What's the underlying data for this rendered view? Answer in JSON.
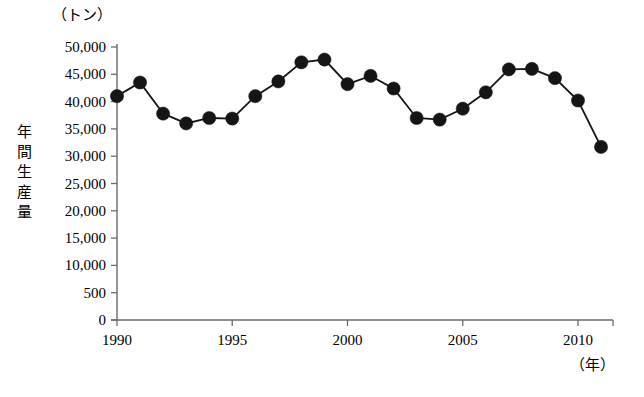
{
  "chart_data": {
    "type": "line",
    "title": "",
    "subtitle": "",
    "xlabel": "（年）",
    "ylabel": "年間生産量",
    "yunit": "（トン）",
    "x": [
      1990,
      1991,
      1992,
      1993,
      1994,
      1995,
      1996,
      1997,
      1998,
      1999,
      2000,
      2001,
      2002,
      2003,
      2004,
      2005,
      2006,
      2007,
      2008,
      2009,
      2010,
      2011
    ],
    "values": [
      41000,
      43500,
      37800,
      36000,
      37000,
      36900,
      41000,
      43700,
      47200,
      47700,
      43200,
      44700,
      42400,
      37000,
      36700,
      38700,
      41700,
      45900,
      46000,
      44300,
      40200,
      31700
    ],
    "series": [
      {
        "name": "年間生産量",
        "values": [
          41000,
          43500,
          37800,
          36000,
          37000,
          36900,
          41000,
          43700,
          47200,
          47700,
          43200,
          44700,
          42400,
          37000,
          36700,
          38700,
          41700,
          45900,
          46000,
          44300,
          40200,
          31700
        ]
      }
    ],
    "xlim": [
      1990,
      2011
    ],
    "ylim": [
      0,
      50000
    ],
    "xticks": [
      1990,
      1995,
      2000,
      2005,
      2010
    ],
    "xticklabels": [
      "1990",
      "1995",
      "2000",
      "2005",
      "2010"
    ],
    "yticks": [
      0,
      5000,
      10000,
      15000,
      20000,
      25000,
      30000,
      35000,
      40000,
      45000,
      50000
    ],
    "yticklabels": [
      "0",
      "500",
      "10,000",
      "15,000",
      "20,000",
      "25,000",
      "30,000",
      "35,000",
      "40,000",
      "45,000",
      "50,000"
    ],
    "grid": false,
    "legend": false,
    "marker": "filled-circle",
    "marker_color": "#151515",
    "line_color": "#151515",
    "axis_color": "#6b6b6b"
  }
}
